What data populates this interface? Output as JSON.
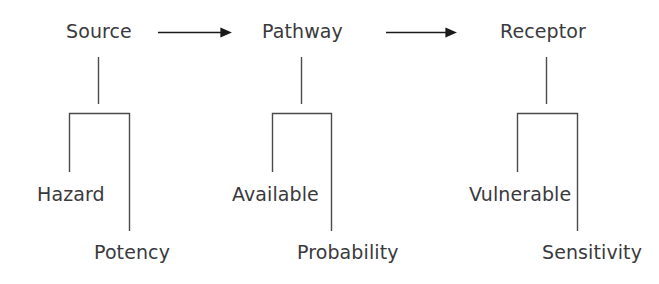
{
  "diagram": {
    "background_color": "#ffffff",
    "text_color": "#3a3a3c",
    "line_color": "#4a4a4c",
    "arrow_color": "#1a1a1a",
    "groups": [
      {
        "id": "source",
        "top_label": "Source",
        "left_label": "Hazard",
        "right_label": "Potency"
      },
      {
        "id": "pathway",
        "top_label": "Pathway",
        "left_label": "Available",
        "right_label": "Probability"
      },
      {
        "id": "receptor",
        "top_label": "Receptor",
        "left_label": "Vulnerable",
        "right_label": "Sensitivity"
      }
    ],
    "connectors": [
      {
        "id": "arrow-source-to-pathway",
        "icon": "right-arrow-icon"
      },
      {
        "id": "arrow-pathway-to-receptor",
        "icon": "right-arrow-icon"
      }
    ]
  }
}
